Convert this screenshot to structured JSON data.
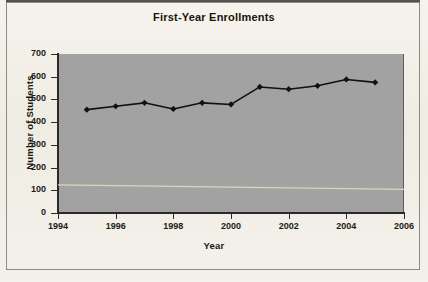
{
  "document": {
    "kind": "scanned-chart-page",
    "background_color": "#f2efe9",
    "frame_color": "#8d8a84"
  },
  "chart_data": {
    "type": "line",
    "title": "First-Year Enrollments",
    "xlabel": "Year",
    "ylabel": "Number of Students",
    "xlim": [
      1994,
      2006
    ],
    "ylim": [
      0,
      700
    ],
    "xticks": [
      1994,
      1996,
      1998,
      2000,
      2002,
      2004,
      2006
    ],
    "yticks": [
      0,
      100,
      200,
      300,
      400,
      500,
      600,
      700
    ],
    "grid": false,
    "legend": null,
    "plot_background_color": "#a2a2a2",
    "series": [
      {
        "name": "First-Year Enrollments",
        "color": "#111111",
        "marker": "diamond",
        "x": [
          1995,
          1996,
          1997,
          1998,
          1999,
          2000,
          2001,
          2002,
          2003,
          2004,
          2005
        ],
        "values": [
          455,
          470,
          485,
          458,
          485,
          478,
          555,
          545,
          560,
          588,
          575
        ]
      },
      {
        "name": "faint-reference-line",
        "color": "#d8d6bd",
        "marker": "none",
        "x": [
          1994,
          2006
        ],
        "values": [
          124,
          104
        ]
      }
    ]
  },
  "axes": {
    "y_tick_labels": [
      "700",
      "600",
      "500",
      "400",
      "300",
      "200",
      "100",
      "0"
    ],
    "x_tick_labels": [
      "1994",
      "1996",
      "1998",
      "2000",
      "2002",
      "2004",
      "2006"
    ]
  }
}
